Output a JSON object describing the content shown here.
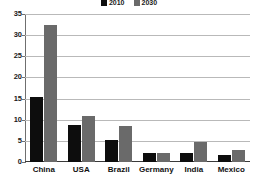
{
  "chart_data": {
    "type": "bar",
    "title": "",
    "subtitle": "",
    "xlabel": "",
    "ylabel": "",
    "categories": [
      "China",
      "USA",
      "Brazil",
      "Germany",
      "India",
      "Mexico"
    ],
    "series": [
      {
        "name": "2010",
        "color": "#0d0d0d",
        "values": [
          15.3,
          8.7,
          5.3,
          2.1,
          2.1,
          1.7
        ]
      },
      {
        "name": "2030",
        "color": "#6a6a6a",
        "values": [
          32.4,
          10.9,
          8.5,
          2.2,
          4.8,
          2.8
        ]
      }
    ],
    "ylim": [
      0,
      35
    ],
    "yticks": [
      0,
      5,
      10,
      15,
      20,
      25,
      30,
      35
    ],
    "ytick_labels": [
      "0",
      "5",
      "10",
      "15",
      "20",
      "25",
      "30",
      "35"
    ],
    "grid": true,
    "legend": {
      "position": "top-center",
      "entries": [
        {
          "label": "2010",
          "color": "#0d0d0d"
        },
        {
          "label": "2030",
          "color": "#6a6a6a"
        }
      ]
    }
  },
  "colors": {
    "series_2010": "#0d0d0d",
    "series_2030": "#6a6a6a",
    "gridline": "#b9b9b9",
    "axis": "#3a3a3a",
    "background": "#ffffff"
  }
}
